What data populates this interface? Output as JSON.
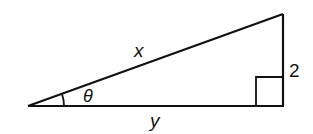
{
  "diagram": {
    "type": "right-triangle",
    "labels": {
      "hypotenuse": "x",
      "opposite": "2",
      "adjacent": "y",
      "angle": "θ"
    },
    "colors": {
      "stroke": "#111111",
      "background": "#ffffff"
    }
  }
}
